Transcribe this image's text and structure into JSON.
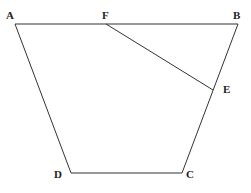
{
  "diagram": {
    "type": "geometry-trapezoid",
    "points": {
      "A": {
        "label": "A",
        "x": 15,
        "y": 24
      },
      "B": {
        "label": "B",
        "x": 238,
        "y": 24
      },
      "C": {
        "label": "C",
        "x": 182,
        "y": 173
      },
      "D": {
        "label": "D",
        "x": 71,
        "y": 173
      },
      "E": {
        "label": "E",
        "x": 213,
        "y": 90
      },
      "F": {
        "label": "F",
        "x": 106,
        "y": 24
      }
    },
    "segments": [
      "AB",
      "BC",
      "CD",
      "DA",
      "FE"
    ]
  }
}
